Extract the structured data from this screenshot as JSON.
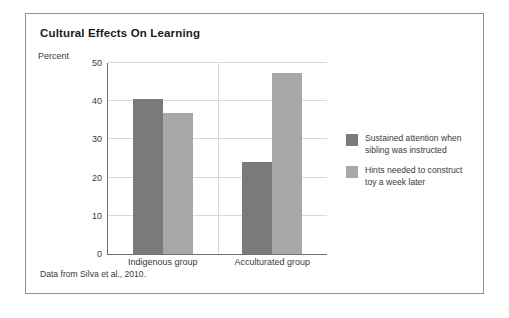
{
  "figure": {
    "title": "Cultural Effects On Learning",
    "source_note": "Data from Silva et al., 2010.",
    "border_color": "#8f9194",
    "background": "#ffffff"
  },
  "chart_data": {
    "type": "bar",
    "title": "Cultural Effects On Learning",
    "xlabel": "",
    "ylabel": "Percent",
    "ylim": [
      0,
      50
    ],
    "yticks": [
      0,
      10,
      20,
      30,
      40,
      50
    ],
    "ytick_labels": [
      "0",
      "10",
      "20",
      "30",
      "40",
      "50"
    ],
    "categories": [
      "Indigenous group",
      "Acculturated group"
    ],
    "grid": true,
    "legend_position": "right",
    "series": [
      {
        "name": "Sustained attention when sibling was instructed",
        "color": "#7a7a7a",
        "values": [
          40.5,
          24
        ]
      },
      {
        "name": "Hints needed to construct toy a week later",
        "color": "#a8a8a8",
        "values": [
          37,
          47.5
        ]
      }
    ]
  },
  "legend": {
    "items": [
      {
        "label": "Sustained attention when sibling was instructed",
        "color": "#7a7a7a"
      },
      {
        "label": "Hints needed to construct toy a week later",
        "color": "#a8a8a8"
      }
    ]
  }
}
